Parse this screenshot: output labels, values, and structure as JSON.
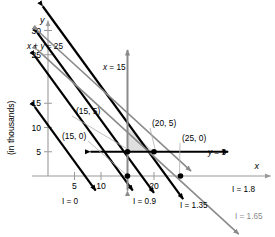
{
  "figure": {
    "axis_label_y": "(in thousands)",
    "axis_name_x": "x",
    "axis_name_y": "y"
  },
  "chart_data": {
    "type": "line",
    "title": "",
    "xlabel": "x",
    "ylabel": "(in thousands)",
    "xlim": [
      -3,
      42
    ],
    "ylim": [
      -4,
      32
    ],
    "grid": false,
    "x_ticks": [
      5,
      10,
      20
    ],
    "x_tick_labels": [
      "5",
      "10",
      "20"
    ],
    "y_ticks": [
      5,
      10,
      15,
      25,
      30
    ],
    "y_tick_labels": [
      "5",
      "10",
      "15",
      "25",
      "30"
    ],
    "colors": {
      "black": "#000000",
      "gray": "#8a8a8a",
      "axis": "#9a9a9a",
      "shade": "#d9d9d9",
      "leader": "#b0b0b0"
    },
    "series": [
      {
        "name": "I = 0",
        "label": "I = 0",
        "color": "#000000",
        "kind": "objective",
        "slope": -1.5,
        "intercept": 10.5,
        "x_from": -2.5,
        "x_to": 9.0
      },
      {
        "name": "I = 0.9",
        "label": "I = 0.9",
        "color": "#000000",
        "kind": "objective",
        "slope": -1.5,
        "intercept": 21.0,
        "x_from": -2.5,
        "x_to": 16.0
      },
      {
        "name": "I = 1.35",
        "label": "I = 1.35",
        "color": "#000000",
        "kind": "objective",
        "slope": -1.5,
        "intercept": 26.5,
        "x_from": -2.0,
        "x_to": 20.0
      },
      {
        "name": "I = 1.8",
        "label": "I = 1.8",
        "color": "#000000",
        "kind": "objective",
        "slope": -1.5,
        "intercept": 33.5,
        "x_from": -1.0,
        "x_to": 25.5
      },
      {
        "name": "I = 1.65",
        "label": "I = 1.65",
        "color": "#8a8a8a",
        "kind": "objective",
        "slope": -1.0,
        "intercept": 24.0,
        "x_from": -2.0,
        "x_to": 36.0
      },
      {
        "name": "x + y = 25",
        "label": "x + y = 25",
        "color": "#8a8a8a",
        "kind": "constraint",
        "slope": -1.0,
        "intercept": 28.0,
        "x_from": -2.0,
        "x_to": 27.0
      }
    ],
    "constraint_lines": [
      {
        "name": "x = 15",
        "label": "x = 15",
        "color": "#8a8a8a",
        "orientation": "vertical",
        "value": 15,
        "from": -3,
        "to": 26
      },
      {
        "name": "y = 5",
        "label": "y = 5",
        "color": "#000000",
        "orientation": "horizontal",
        "value": 5,
        "from": 8,
        "to": 34
      }
    ],
    "feasible_region": [
      [
        15,
        5
      ],
      [
        20,
        5
      ],
      [
        15,
        10
      ]
    ],
    "points": [
      {
        "label": "(15, 5)",
        "x": 15,
        "y": 5,
        "marked": true,
        "label_x": 21.5,
        "label_y": 15.5
      },
      {
        "label": "(20, 5)",
        "x": 20,
        "y": 5,
        "marked": true,
        "label_x": 26.5,
        "label_y": 12.0
      },
      {
        "label": "(25, 0)",
        "x": 25,
        "y": 0,
        "marked": true,
        "label_x": 31.0,
        "label_y": 8.6
      },
      {
        "label": "(15, 0)",
        "x": 15,
        "y": 0,
        "marked": true,
        "label_x": 5.0,
        "label_y": 3.2
      }
    ],
    "line_labels": [
      {
        "text": "x + y = 25",
        "x": 27,
        "y": 49,
        "color": "#000000",
        "size": 8.2,
        "italic_x": true
      },
      {
        "text": "x = 15",
        "x": 103,
        "y": 70,
        "color": "#000000",
        "size": 8.2,
        "italic_x": true
      },
      {
        "text": "y = 5",
        "x": 208,
        "y": 155,
        "color": "#000000",
        "size": 8.2,
        "italic_x": true
      },
      {
        "text": "I = 0",
        "x": 62,
        "y": 204,
        "color": "#000000",
        "size": 8.2,
        "italic_x": false
      },
      {
        "text": "I = 0.9",
        "x": 133,
        "y": 204,
        "color": "#000000",
        "size": 8.2,
        "italic_x": false
      },
      {
        "text": "I = 1.35",
        "x": 180,
        "y": 208,
        "color": "#000000",
        "size": 8.2,
        "italic_x": false
      },
      {
        "text": "I = 1.8",
        "x": 232,
        "y": 192,
        "color": "#000000",
        "size": 8.2,
        "italic_x": false
      },
      {
        "text": "I = 1.65",
        "x": 235,
        "y": 219,
        "color": "#8a8a8a",
        "size": 8.2,
        "italic_x": false
      }
    ]
  }
}
